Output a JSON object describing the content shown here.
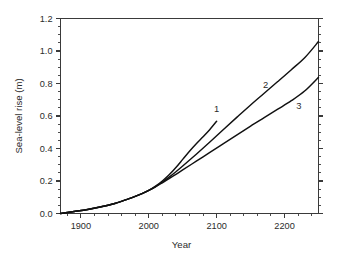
{
  "chart_data": {
    "type": "line",
    "title": "",
    "xlabel": "Year",
    "ylabel": "Sea-level rise (m)",
    "xlim": [
      1870,
      2250
    ],
    "ylim": [
      0.0,
      1.2
    ],
    "grid": false,
    "legend_position": "inline-end-of-line",
    "xticks": [
      1900,
      2000,
      2100,
      2200
    ],
    "xtick_labels": [
      "1900",
      "2000",
      "2100",
      "2200"
    ],
    "xminor_step": 20,
    "yticks": [
      0.0,
      0.2,
      0.4,
      0.6,
      0.8,
      1.0,
      1.2
    ],
    "ytick_labels": [
      "0.0",
      "0.2",
      "0.4",
      "0.6",
      "0.8",
      "1.0",
      "1.2"
    ],
    "yminor_step": 0.05,
    "series": [
      {
        "name": "1",
        "label": "1",
        "color": "#111111",
        "label_x": 2100,
        "label_y": 0.645,
        "x": [
          1870,
          1890,
          1910,
          1930,
          1950,
          1970,
          1980,
          1990,
          2000,
          2010,
          2020,
          2030,
          2040,
          2050,
          2060,
          2070,
          2080,
          2090,
          2100
        ],
        "y": [
          0.0,
          0.012,
          0.025,
          0.042,
          0.062,
          0.09,
          0.105,
          0.122,
          0.142,
          0.168,
          0.2,
          0.238,
          0.283,
          0.333,
          0.383,
          0.429,
          0.472,
          0.517,
          0.568
        ]
      },
      {
        "name": "2",
        "label": "2",
        "color": "#111111",
        "label_x": 2172,
        "label_y": 0.795,
        "x": [
          1870,
          1890,
          1910,
          1930,
          1950,
          1970,
          1980,
          1990,
          2000,
          2010,
          2020,
          2030,
          2040,
          2050,
          2070,
          2090,
          2110,
          2130,
          2150,
          2170,
          2190,
          2210,
          2230,
          2250
        ],
        "y": [
          0.0,
          0.012,
          0.025,
          0.042,
          0.062,
          0.09,
          0.105,
          0.122,
          0.142,
          0.166,
          0.194,
          0.224,
          0.257,
          0.292,
          0.365,
          0.44,
          0.517,
          0.593,
          0.668,
          0.74,
          0.812,
          0.885,
          0.96,
          1.058
        ]
      },
      {
        "name": "3",
        "label": "3",
        "color": "#111111",
        "label_x": 2221,
        "label_y": 0.665,
        "x": [
          1870,
          1890,
          1910,
          1930,
          1950,
          1970,
          1980,
          1990,
          2000,
          2010,
          2020,
          2030,
          2040,
          2050,
          2070,
          2090,
          2110,
          2130,
          2150,
          2170,
          2190,
          2210,
          2230,
          2250
        ],
        "y": [
          0.0,
          0.012,
          0.025,
          0.042,
          0.062,
          0.09,
          0.105,
          0.122,
          0.142,
          0.164,
          0.189,
          0.215,
          0.241,
          0.268,
          0.322,
          0.376,
          0.43,
          0.484,
          0.538,
          0.59,
          0.642,
          0.694,
          0.755,
          0.838
        ]
      }
    ]
  }
}
